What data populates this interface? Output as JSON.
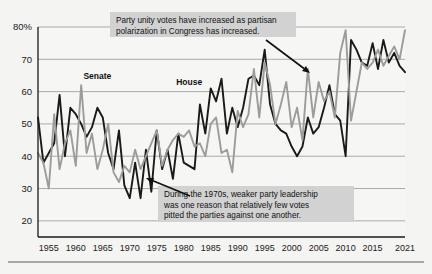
{
  "chart_data": {
    "type": "line",
    "title": "",
    "xlabel": "",
    "ylabel": "",
    "xlim": [
      1953,
      2021
    ],
    "ylim": [
      15,
      80
    ],
    "grid": true,
    "legend_position": "inline-labels",
    "y_ticks": [
      "80%",
      "70",
      "60",
      "50",
      "40",
      "30",
      "20"
    ],
    "y_tick_values": [
      80,
      70,
      60,
      50,
      40,
      30,
      20
    ],
    "x_ticks": [
      "1955",
      "1960",
      "1965",
      "1970",
      "1975",
      "1980",
      "1985",
      "1990",
      "1995",
      "2000",
      "2005",
      "2010",
      "2015",
      "2021"
    ],
    "x_tick_values": [
      1955,
      1960,
      1965,
      1970,
      1975,
      1980,
      1985,
      1990,
      1995,
      2000,
      2005,
      2010,
      2015,
      2021
    ],
    "series": [
      {
        "name": "House",
        "color": "#1a1a1a",
        "label_x": 1981,
        "label_y": 62,
        "x": [
          1953,
          1954,
          1955,
          1956,
          1957,
          1958,
          1959,
          1960,
          1961,
          1962,
          1963,
          1964,
          1965,
          1966,
          1967,
          1968,
          1969,
          1970,
          1971,
          1972,
          1973,
          1974,
          1975,
          1976,
          1977,
          1978,
          1979,
          1980,
          1981,
          1982,
          1983,
          1984,
          1985,
          1986,
          1987,
          1988,
          1989,
          1990,
          1991,
          1992,
          1993,
          1994,
          1995,
          1996,
          1997,
          1998,
          1999,
          2000,
          2001,
          2002,
          2003,
          2004,
          2005,
          2006,
          2007,
          2008,
          2009,
          2010,
          2011,
          2012,
          2013,
          2014,
          2015,
          2016,
          2017,
          2018,
          2019,
          2020,
          2021
        ],
        "values": [
          52,
          38,
          41,
          44,
          59,
          40,
          55,
          53,
          50,
          46,
          49,
          55,
          52,
          41,
          36,
          48,
          31,
          27,
          38,
          27,
          42,
          29,
          48,
          36,
          42,
          33,
          47,
          38,
          37,
          36,
          56,
          47,
          61,
          57,
          64,
          47,
          55,
          49,
          55,
          64,
          65,
          62,
          73,
          56,
          50,
          48,
          47,
          43,
          40,
          43,
          52,
          47,
          49,
          55,
          62,
          53,
          51,
          40,
          76,
          73,
          69,
          68,
          75,
          67,
          76,
          69,
          72,
          68,
          66
        ],
        "notes": "Party unity votes, U.S. House of Representatives, percent"
      },
      {
        "name": "Senate",
        "color": "#9c9c9c",
        "label_x": 1964,
        "label_y": 64,
        "x": [
          1953,
          1954,
          1955,
          1956,
          1957,
          1958,
          1959,
          1960,
          1961,
          1962,
          1963,
          1964,
          1965,
          1966,
          1967,
          1968,
          1969,
          1970,
          1971,
          1972,
          1973,
          1974,
          1975,
          1976,
          1977,
          1978,
          1979,
          1980,
          1981,
          1982,
          1983,
          1984,
          1985,
          1986,
          1987,
          1988,
          1989,
          1990,
          1991,
          1992,
          1993,
          1994,
          1995,
          1996,
          1997,
          1998,
          1999,
          2000,
          2001,
          2002,
          2003,
          2004,
          2005,
          2006,
          2007,
          2008,
          2009,
          2010,
          2011,
          2012,
          2013,
          2014,
          2015,
          2016,
          2017,
          2018,
          2019,
          2020,
          2021
        ],
        "values": [
          41,
          38,
          30,
          53,
          36,
          44,
          48,
          37,
          62,
          41,
          47,
          36,
          42,
          50,
          35,
          32,
          37,
          35,
          42,
          36,
          40,
          44,
          48,
          37,
          42,
          45,
          47,
          46,
          48,
          43,
          44,
          40,
          50,
          52,
          41,
          42,
          35,
          54,
          49,
          53,
          67,
          52,
          69,
          62,
          50,
          56,
          63,
          49,
          55,
          45,
          67,
          52,
          63,
          57,
          60,
          52,
          72,
          79,
          51,
          60,
          69,
          67,
          69,
          73,
          68,
          71,
          74,
          70,
          79
        ],
        "notes": "Party unity votes, U.S. Senate, percent"
      }
    ],
    "annotations": [
      {
        "id": "annotation-top",
        "text_lines": [
          "Party unity votes have increased as partisan",
          "polarization in Congress has increased."
        ],
        "box": {
          "x": 110,
          "y": 12,
          "width": 186,
          "height": 25
        },
        "arrow": {
          "x1": 266,
          "y1": 40,
          "x2": 310,
          "y2": 73
        }
      },
      {
        "id": "annotation-bottom",
        "text_lines": [
          "During the 1970s, weaker party leadership",
          "was one reason that relatively few votes",
          "pitted the parties against one another."
        ],
        "box": {
          "x": 158,
          "y": 186,
          "width": 196,
          "height": 36
        },
        "arrow": {
          "x1": 190,
          "y1": 196,
          "x2": 146,
          "y2": 178
        }
      }
    ]
  },
  "colors": {
    "background": "#f4f4f2",
    "plot_background": "#f6f6f4",
    "house_line": "#1a1a1a",
    "senate_line": "#9c9c9c",
    "gridline": "#8a8a8a",
    "axis": "#1a1a1a",
    "annotation_box": "#d2d2d2",
    "annotation_text": "#111111",
    "bottom_rule": "#5a5a5a"
  }
}
